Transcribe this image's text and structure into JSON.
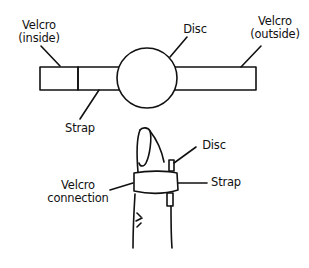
{
  "diagram": {
    "top_view": {
      "labels": {
        "velcro_inside_line1": "Velcro",
        "velcro_inside_line2": "(inside)",
        "disc": "Disc",
        "velcro_outside_line1": "Velcro",
        "velcro_outside_line2": "(outside)",
        "strap": "Strap"
      }
    },
    "finger_view": {
      "labels": {
        "disc": "Disc",
        "velcro_connection_line1": "Velcro",
        "velcro_connection_line2": "connection",
        "strap": "Strap"
      }
    },
    "colors": {
      "line": "#111111",
      "background": "#ffffff"
    }
  }
}
